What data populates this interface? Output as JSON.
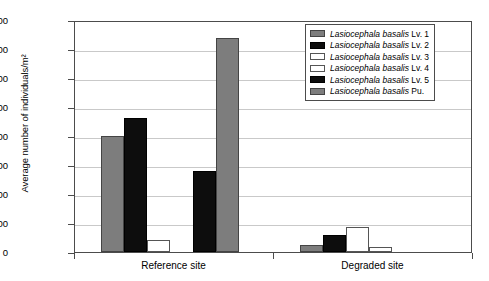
{
  "chart_data": {
    "type": "bar",
    "title": "",
    "xlabel": "",
    "ylabel": "Average number of individuals/m²",
    "ylim": [
      0,
      1600
    ],
    "ytick_step": 200,
    "yticks": [
      0,
      200,
      400,
      600,
      800,
      1000,
      1200,
      1400,
      1600
    ],
    "grid": true,
    "legend_position": "top-right",
    "categories": [
      "Reference site",
      "Degraded site"
    ],
    "series": [
      {
        "name": "Lasiocephala basalis Lv. 1",
        "genus_species": "Lasiocephala basalis",
        "stage": "Lv. 1",
        "color": "#7d7d7d",
        "swatch": "gray",
        "values": [
          800,
          50
        ]
      },
      {
        "name": "Lasiocephala basalis Lv. 2",
        "genus_species": "Lasiocephala basalis",
        "stage": "Lv. 2",
        "color": "#0d0d0d",
        "swatch": "black",
        "values": [
          925,
          120
        ]
      },
      {
        "name": "Lasiocephala basalis Lv. 3",
        "genus_species": "Lasiocephala basalis",
        "stage": "Lv. 3",
        "color": "#ffffff",
        "swatch": "white",
        "values": [
          80,
          175
        ]
      },
      {
        "name": "Lasiocephala basalis Lv. 4",
        "genus_species": "Lasiocephala basalis",
        "stage": "Lv. 4",
        "color": "#ffffff",
        "swatch": "white",
        "values": [
          0,
          35
        ]
      },
      {
        "name": "Lasiocephala basalis Lv. 5",
        "genus_species": "Lasiocephala basalis",
        "stage": "Lv. 5",
        "color": "#0d0d0d",
        "swatch": "black",
        "values": [
          560,
          0
        ]
      },
      {
        "name": "Lasiocephala basalis Pu.",
        "genus_species": "Lasiocephala basalis",
        "stage": "Pu.",
        "color": "#7d7d7d",
        "swatch": "gray",
        "values": [
          1475,
          0
        ]
      }
    ]
  },
  "axis": {
    "y_title": "Average number of individuals/m²",
    "y_tick_labels": [
      "1600",
      "1400",
      "1200",
      "1000",
      "800",
      "600",
      "400",
      "200",
      "0"
    ],
    "x_tick_labels": [
      "Reference site",
      "Degraded site"
    ]
  },
  "legend": {
    "items": [
      {
        "species": "Lasiocephala basalis",
        "suffix": " Lv. 1",
        "swatch": "gray"
      },
      {
        "species": "Lasiocephala basalis",
        "suffix": " Lv. 2",
        "swatch": "black"
      },
      {
        "species": "Lasiocephala basalis",
        "suffix": " Lv. 3",
        "swatch": "white"
      },
      {
        "species": "Lasiocephala basalis",
        "suffix": " Lv. 4",
        "swatch": "white"
      },
      {
        "species": "Lasiocephala basalis",
        "suffix": " Lv. 5",
        "swatch": "black"
      },
      {
        "species": "Lasiocephala basalis",
        "suffix": " Pu.",
        "swatch": "gray"
      }
    ]
  },
  "colors": {
    "gray": "#7d7d7d",
    "black": "#0d0d0d",
    "white": "#ffffff",
    "grid": "#c9c9c9",
    "axis": "#4c4c4c"
  }
}
